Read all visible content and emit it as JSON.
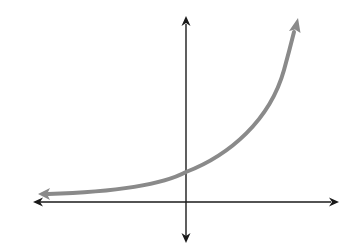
{
  "figure": {
    "function_type": "exponential growth",
    "axes": {
      "x_axis": "horizontal, arrows both ends",
      "y_axis": "vertical, arrows both ends",
      "labels": "none"
    },
    "curve": {
      "color": "#8a8a8a",
      "left_asymptote": "approaches x-axis from above",
      "y_intercept": "positive, small",
      "right_behavior": "increases rapidly"
    },
    "colors": {
      "axes": "#1a1a1a",
      "curve": "#8a8a8a",
      "background": "#ffffff"
    }
  }
}
